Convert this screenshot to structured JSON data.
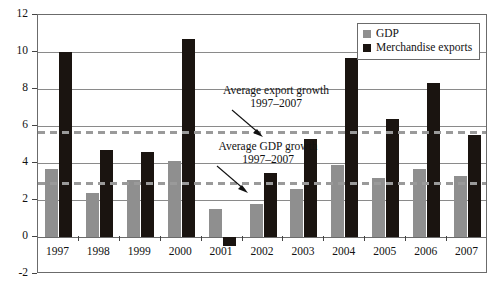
{
  "chart_data": {
    "type": "bar",
    "title": "",
    "subtitle": "",
    "xlabel": "",
    "ylabel": "",
    "categories": [
      "1997",
      "1998",
      "1999",
      "2000",
      "2001",
      "2002",
      "2003",
      "2004",
      "2005",
      "2006",
      "2007"
    ],
    "series": [
      {
        "name": "GDP",
        "color": "#8f8f8f",
        "values": [
          3.7,
          2.4,
          3.1,
          4.1,
          1.5,
          1.8,
          2.6,
          3.9,
          3.2,
          3.7,
          3.3
        ]
      },
      {
        "name": "Merchandise exports",
        "color": "#1a1410",
        "values": [
          10.0,
          4.7,
          4.6,
          10.7,
          -0.5,
          3.45,
          5.3,
          9.7,
          6.4,
          8.3,
          5.5
        ]
      }
    ],
    "ylim": [
      -2,
      12
    ],
    "ytick_values": [
      12,
      10,
      8,
      6,
      4,
      2,
      0,
      -2
    ],
    "ytick_labels": [
      "12",
      "10",
      "8",
      "6",
      "4",
      "2",
      "0",
      "-2"
    ],
    "grid": true,
    "legend_position": "top-right",
    "reference_lines": [
      {
        "name": "average-export-growth",
        "value": 5.7,
        "style": "dashed",
        "color": "#9a9a9a",
        "label_line1": "Average export growth",
        "label_line2": "1997–2007"
      },
      {
        "name": "average-gdp-growth",
        "value": 2.9,
        "style": "dashed",
        "color": "#9a9a9a",
        "label_line1": "Average GDP growth",
        "label_line2": "1997–2007"
      }
    ]
  },
  "legend": {
    "items": [
      {
        "label": "GDP",
        "swatch": "gdp"
      },
      {
        "label": "Merchandise exports",
        "swatch": "exp"
      }
    ]
  }
}
